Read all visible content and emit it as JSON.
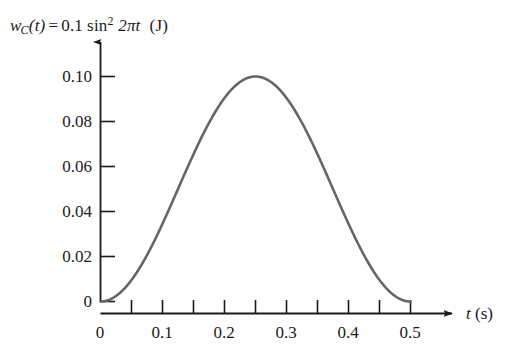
{
  "figure": {
    "title_parts": {
      "w": "w",
      "sub_c": "C",
      "of_t": "(t)",
      "equals": "=",
      "amplitude": "0.1",
      "fn": "sin",
      "exponent": "2",
      "argument": "2πt",
      "unit": "(J)"
    },
    "title_plain": "w_C(t) = 0.1 sin² 2πt  (J)"
  },
  "chart_data": {
    "type": "line",
    "xlabel": "t (s)",
    "ylabel": "",
    "xlabel_parts": {
      "symbol": "t",
      "unit": "(s)"
    },
    "xlim": [
      0,
      0.5
    ],
    "ylim": [
      0,
      0.105
    ],
    "grid": false,
    "legend": false,
    "curve_color": "#666666",
    "axis_color": "#1a1a1a",
    "line_width": 2.6,
    "x_ticks_major": [
      0,
      0.1,
      0.2,
      0.3,
      0.4,
      0.5
    ],
    "x_tick_labels": [
      "0",
      "0.1",
      "0.2",
      "0.3",
      "0.4",
      "0.5"
    ],
    "x_ticks_minor": [
      0.05,
      0.15,
      0.25,
      0.35,
      0.45
    ],
    "y_ticks": [
      0,
      0.02,
      0.04,
      0.06,
      0.08,
      0.1
    ],
    "y_tick_labels": [
      "0",
      "0.02",
      "0.04",
      "0.06",
      "0.08",
      "0.10"
    ],
    "series": [
      {
        "name": "w_C(t) = 0.1 sin^2 2πt",
        "x": [
          0.0,
          0.0125,
          0.025,
          0.0375,
          0.05,
          0.0625,
          0.075,
          0.0875,
          0.1,
          0.1125,
          0.125,
          0.1375,
          0.15,
          0.1625,
          0.175,
          0.1875,
          0.2,
          0.2125,
          0.225,
          0.2375,
          0.25,
          0.2625,
          0.275,
          0.2875,
          0.3,
          0.3125,
          0.325,
          0.3375,
          0.35,
          0.3625,
          0.375,
          0.3875,
          0.4,
          0.4125,
          0.425,
          0.4375,
          0.45,
          0.4625,
          0.475,
          0.4875,
          0.5
        ],
        "y": [
          0.0,
          0.00152,
          0.00586,
          0.01254,
          0.02071,
          0.02929,
          0.03746,
          0.04415,
          0.04849,
          0.05,
          0.04849,
          0.04415,
          0.03746,
          0.02929,
          0.02071,
          0.01254,
          0.00586,
          0.00152,
          0.0,
          0.00152,
          0.00586,
          0.01254,
          0.02071,
          0.02929,
          0.03746,
          0.04415,
          0.04849,
          0.05,
          0.04849,
          0.04415,
          0.03746,
          0.02929,
          0.02071,
          0.01254,
          0.00586,
          0.00152,
          0.0,
          0.00152,
          0.00586,
          0.01254,
          0.02071
        ]
      }
    ],
    "formula": {
      "amplitude": 0.1,
      "expression": "0.1 * sin(2*pi*t)^2",
      "peak_value": 0.1,
      "peak_time": 0.25,
      "zeros": [
        0.0,
        0.5
      ]
    }
  }
}
